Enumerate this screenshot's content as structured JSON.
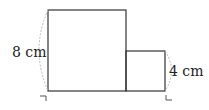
{
  "figure": {
    "large_square": {
      "side_label": "8 cm"
    },
    "small_square": {
      "side_label": "4 cm"
    },
    "colors": {
      "stroke": "#333333",
      "brace": "#bbbbbb"
    }
  }
}
